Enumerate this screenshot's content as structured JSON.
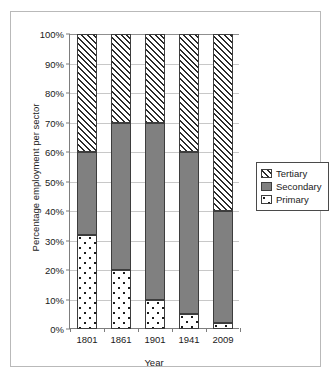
{
  "chart_data": {
    "type": "bar",
    "stacked": true,
    "title": "",
    "xlabel": "Year",
    "ylabel": "Percentage employment per sector",
    "categories": [
      "1801",
      "1861",
      "1901",
      "1941",
      "2009"
    ],
    "series": [
      {
        "name": "Primary",
        "values": [
          32,
          20,
          10,
          5,
          2
        ]
      },
      {
        "name": "Secondary",
        "values": [
          28,
          50,
          60,
          55,
          38
        ]
      },
      {
        "name": "Tertiary",
        "values": [
          40,
          30,
          30,
          40,
          60
        ]
      }
    ],
    "cumulative_tops": {
      "primary": [
        32,
        20,
        10,
        5,
        2
      ],
      "secondary": [
        60,
        70,
        70,
        60,
        40
      ],
      "tertiary": [
        100,
        100,
        100,
        100,
        100
      ]
    },
    "ylim": [
      0,
      100
    ],
    "y_ticks": [
      "0%",
      "10%",
      "20%",
      "30%",
      "40%",
      "50%",
      "60%",
      "70%",
      "80%",
      "90%",
      "100%"
    ],
    "y_tick_values": [
      0,
      10,
      20,
      30,
      40,
      50,
      60,
      70,
      80,
      90,
      100
    ],
    "grid": true,
    "legend_position": "right",
    "legend": [
      {
        "label": "Tertiary",
        "pattern": "diagonal-hatch",
        "color": "#ffffff"
      },
      {
        "label": "Secondary",
        "pattern": "solid",
        "color": "#808080"
      },
      {
        "label": "Primary",
        "pattern": "dotted",
        "color": "#ffffff"
      }
    ],
    "colors": {
      "primary": "#ffffff",
      "secondary": "#808080",
      "tertiary": "#ffffff",
      "outline": "#3d3d3d",
      "grid": "#c8c8c8",
      "axis": "#7d7d7d",
      "frame": "#b9b9b9",
      "text": "#1a1a1a"
    }
  }
}
